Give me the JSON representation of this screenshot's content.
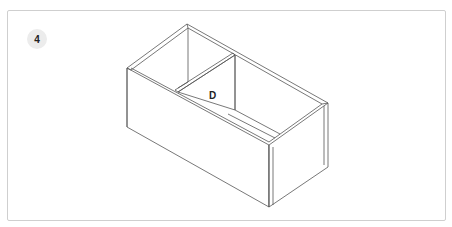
{
  "step": {
    "number": "4"
  },
  "diagram": {
    "part_label": "D",
    "line_color": "#555555",
    "frame_border_color": "#cfcfcf",
    "badge_color": "#ececec"
  }
}
